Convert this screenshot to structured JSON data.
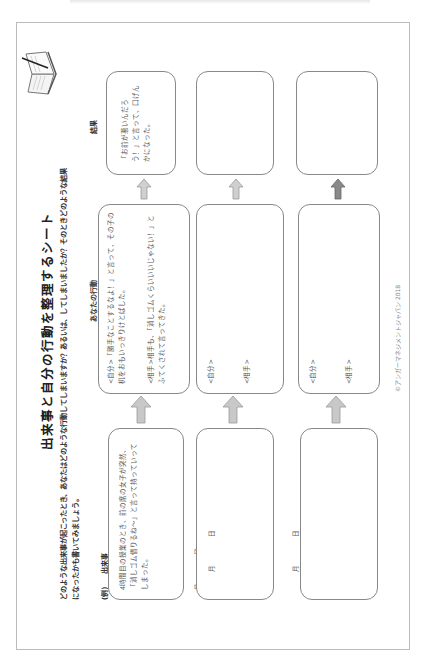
{
  "sheet": {
    "title": "出来事と自分の行動を整理するシート",
    "intro_line1": "どのような出来事が起こったとき、あなたはどのような行動してしまいますか？あるいは、してしまいましたか？そのときどのような結果",
    "intro_line2": "になったかも書いてみましょう。",
    "example_label": "(例)",
    "columns": {
      "event": "出来事",
      "action": "あなたの行動",
      "result": "結果"
    },
    "date_month": "月",
    "date_day": "日",
    "rows": [
      {
        "event_text": "4時間目の授業のとき、前の席の女子が突然、「消しゴム借りるね～」と言って持っていってしまった。",
        "action_self": "<自分>「勝手なことするなよ！」と言って、その子の机をおもいっきりけとばした。",
        "action_other": "<相手>相手も、「消しゴムくらいいいじゃない！」とふてくされて言ってきた。",
        "result_text": "「お前が悪いんだろう！」と言って、口げんかになった。"
      },
      {
        "event_text": "",
        "action_self": "<自分>",
        "action_other": "<相手>",
        "result_text": ""
      },
      {
        "event_text": "",
        "action_self": "<自分>",
        "action_other": "<相手>",
        "result_text": ""
      }
    ],
    "copyright": "©アンガーマネジメントジャパン 2018",
    "icons": {
      "book": "open-book-with-pen-icon",
      "arrow": "up-arrow-icon"
    },
    "colors": {
      "frame": "#bbbbbb",
      "box_border": "#888888",
      "arrow_light": "#c8c8c8",
      "arrow_dark": "#8a8a8a"
    }
  }
}
